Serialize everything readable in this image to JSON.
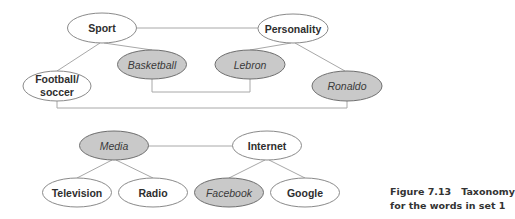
{
  "diagram": {
    "type": "taxonomy",
    "colors": {
      "edge": "#a8a8a8",
      "plain_fill": "#ffffff",
      "shaded_fill": "#c9c9c9",
      "text": "#2e2e2e"
    },
    "nodes": {
      "sport": {
        "label": "Sport",
        "style": "plain"
      },
      "personality": {
        "label": "Personality",
        "style": "plain"
      },
      "football": {
        "label_line1": "Football/",
        "label_line2": "soccer",
        "style": "plain"
      },
      "basketball": {
        "label": "Basketball",
        "style": "shaded"
      },
      "lebron": {
        "label": "Lebron",
        "style": "shaded"
      },
      "ronaldo": {
        "label": "Ronaldo",
        "style": "shaded"
      },
      "media": {
        "label": "Media",
        "style": "shaded"
      },
      "internet": {
        "label": "Internet",
        "style": "plain"
      },
      "television": {
        "label": "Television",
        "style": "plain"
      },
      "radio": {
        "label": "Radio",
        "style": "plain"
      },
      "facebook": {
        "label": "Facebook",
        "style": "shaded"
      },
      "google": {
        "label": "Google",
        "style": "plain"
      }
    },
    "edges": [
      [
        "Sport",
        "Personality"
      ],
      [
        "Sport",
        "Football/soccer"
      ],
      [
        "Sport",
        "Basketball"
      ],
      [
        "Personality",
        "Lebron"
      ],
      [
        "Personality",
        "Ronaldo"
      ],
      [
        "Basketball",
        "Lebron"
      ],
      [
        "Football/soccer",
        "Ronaldo"
      ],
      [
        "Media",
        "Internet"
      ],
      [
        "Media",
        "Television"
      ],
      [
        "Media",
        "Radio"
      ],
      [
        "Internet",
        "Facebook"
      ],
      [
        "Internet",
        "Google"
      ]
    ]
  },
  "caption": {
    "figure_label": "Figure 7.13",
    "title_line1": "Taxonomy",
    "title_line2": "for the words in set 1"
  }
}
